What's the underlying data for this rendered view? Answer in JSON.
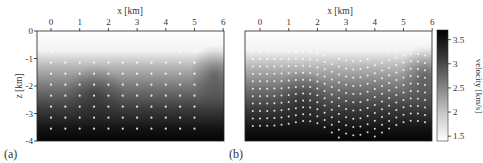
{
  "figure": {
    "panels": [
      {
        "id": "a",
        "label": "(a)",
        "xlabel": "x [km]",
        "ylabel": "z [km]"
      },
      {
        "id": "b",
        "label": "(b)",
        "xlabel": "x [km]",
        "ylabel": ""
      }
    ],
    "colorbar": {
      "label": "velocity [km/s]",
      "ticks": [
        "1.5",
        "2",
        "2.5",
        "3",
        "3.5"
      ],
      "range": [
        1.4,
        3.7
      ],
      "colormap": "white-to-black"
    }
  },
  "chart_data": [
    {
      "type": "heatmap",
      "title": "(a)",
      "xlabel": "x [km]",
      "ylabel": "z [km]",
      "x_ticks": [
        0,
        1,
        2,
        3,
        4,
        5,
        6
      ],
      "y_ticks": [
        0,
        -1,
        -2,
        -3,
        -4
      ],
      "xlim": [
        -0.5,
        6
      ],
      "ylim": [
        -4,
        0
      ],
      "grid": false,
      "description": "Grayscale velocity model; low velocity (white, ~1.5 km/s) near surface with deeper low-velocity bulge near x=3 km, increasing to ~3.7 km/s (black) at depth. White dots mark a regular grid of sample points.",
      "points_x_km": [
        0,
        0.5,
        1,
        1.5,
        2,
        2.5,
        3,
        3.5,
        4,
        4.5,
        5
      ],
      "points_z_km": [
        -0.75,
        -1.15,
        -1.55,
        -1.95,
        -2.35,
        -2.75,
        -3.15,
        -3.55
      ]
    },
    {
      "type": "heatmap",
      "title": "(b)",
      "xlabel": "x [km]",
      "ylabel": "z [km]",
      "x_ticks": [
        0,
        1,
        2,
        3,
        4,
        5,
        6
      ],
      "xlim": [
        -0.5,
        6
      ],
      "ylim": [
        -4,
        0
      ],
      "grid": false,
      "description": "Same velocity model; white dots follow warped layers (isovelocity contours), dipping downward near x=3.3 km.",
      "layer_count": 11
    }
  ],
  "colorbar_ticks": [
    {
      "value": 1.5,
      "label": "1.5"
    },
    {
      "value": 2.0,
      "label": "2"
    },
    {
      "value": 2.5,
      "label": "2.5"
    },
    {
      "value": 3.0,
      "label": "3"
    },
    {
      "value": 3.5,
      "label": "3.5"
    }
  ],
  "x_tick_labels": [
    "0",
    "1",
    "2",
    "3",
    "4",
    "5",
    "6"
  ],
  "z_tick_labels": [
    "0",
    "-1",
    "-2",
    "-3",
    "-4"
  ]
}
